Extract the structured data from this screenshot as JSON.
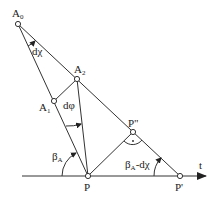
{
  "diagram": {
    "points": {
      "A0": {
        "label": "A",
        "sub": "0",
        "x": 18,
        "y": 24
      },
      "A1": {
        "label": "A",
        "sub": "1",
        "x": 54,
        "y": 101
      },
      "A2": {
        "label": "A",
        "sub": "2",
        "x": 77,
        "y": 79
      },
      "P": {
        "label": "P",
        "x": 88,
        "y": 176
      },
      "P2": {
        "label": "P\"",
        "x": 133,
        "y": 132
      },
      "P1": {
        "label": "P'",
        "x": 180,
        "y": 176
      }
    },
    "axis": {
      "label": "t"
    },
    "angles": {
      "dchi": {
        "label": "dχ"
      },
      "dphi": {
        "label": "dφ"
      },
      "betaA": {
        "label": "β",
        "sub": "A"
      },
      "betaA_minus_dchi": {
        "label": "β",
        "sub": "A",
        "suffix": "-dχ"
      }
    },
    "right_angle_marker": "•",
    "colors": {
      "line": "#333333",
      "background": "#ffffff"
    }
  }
}
